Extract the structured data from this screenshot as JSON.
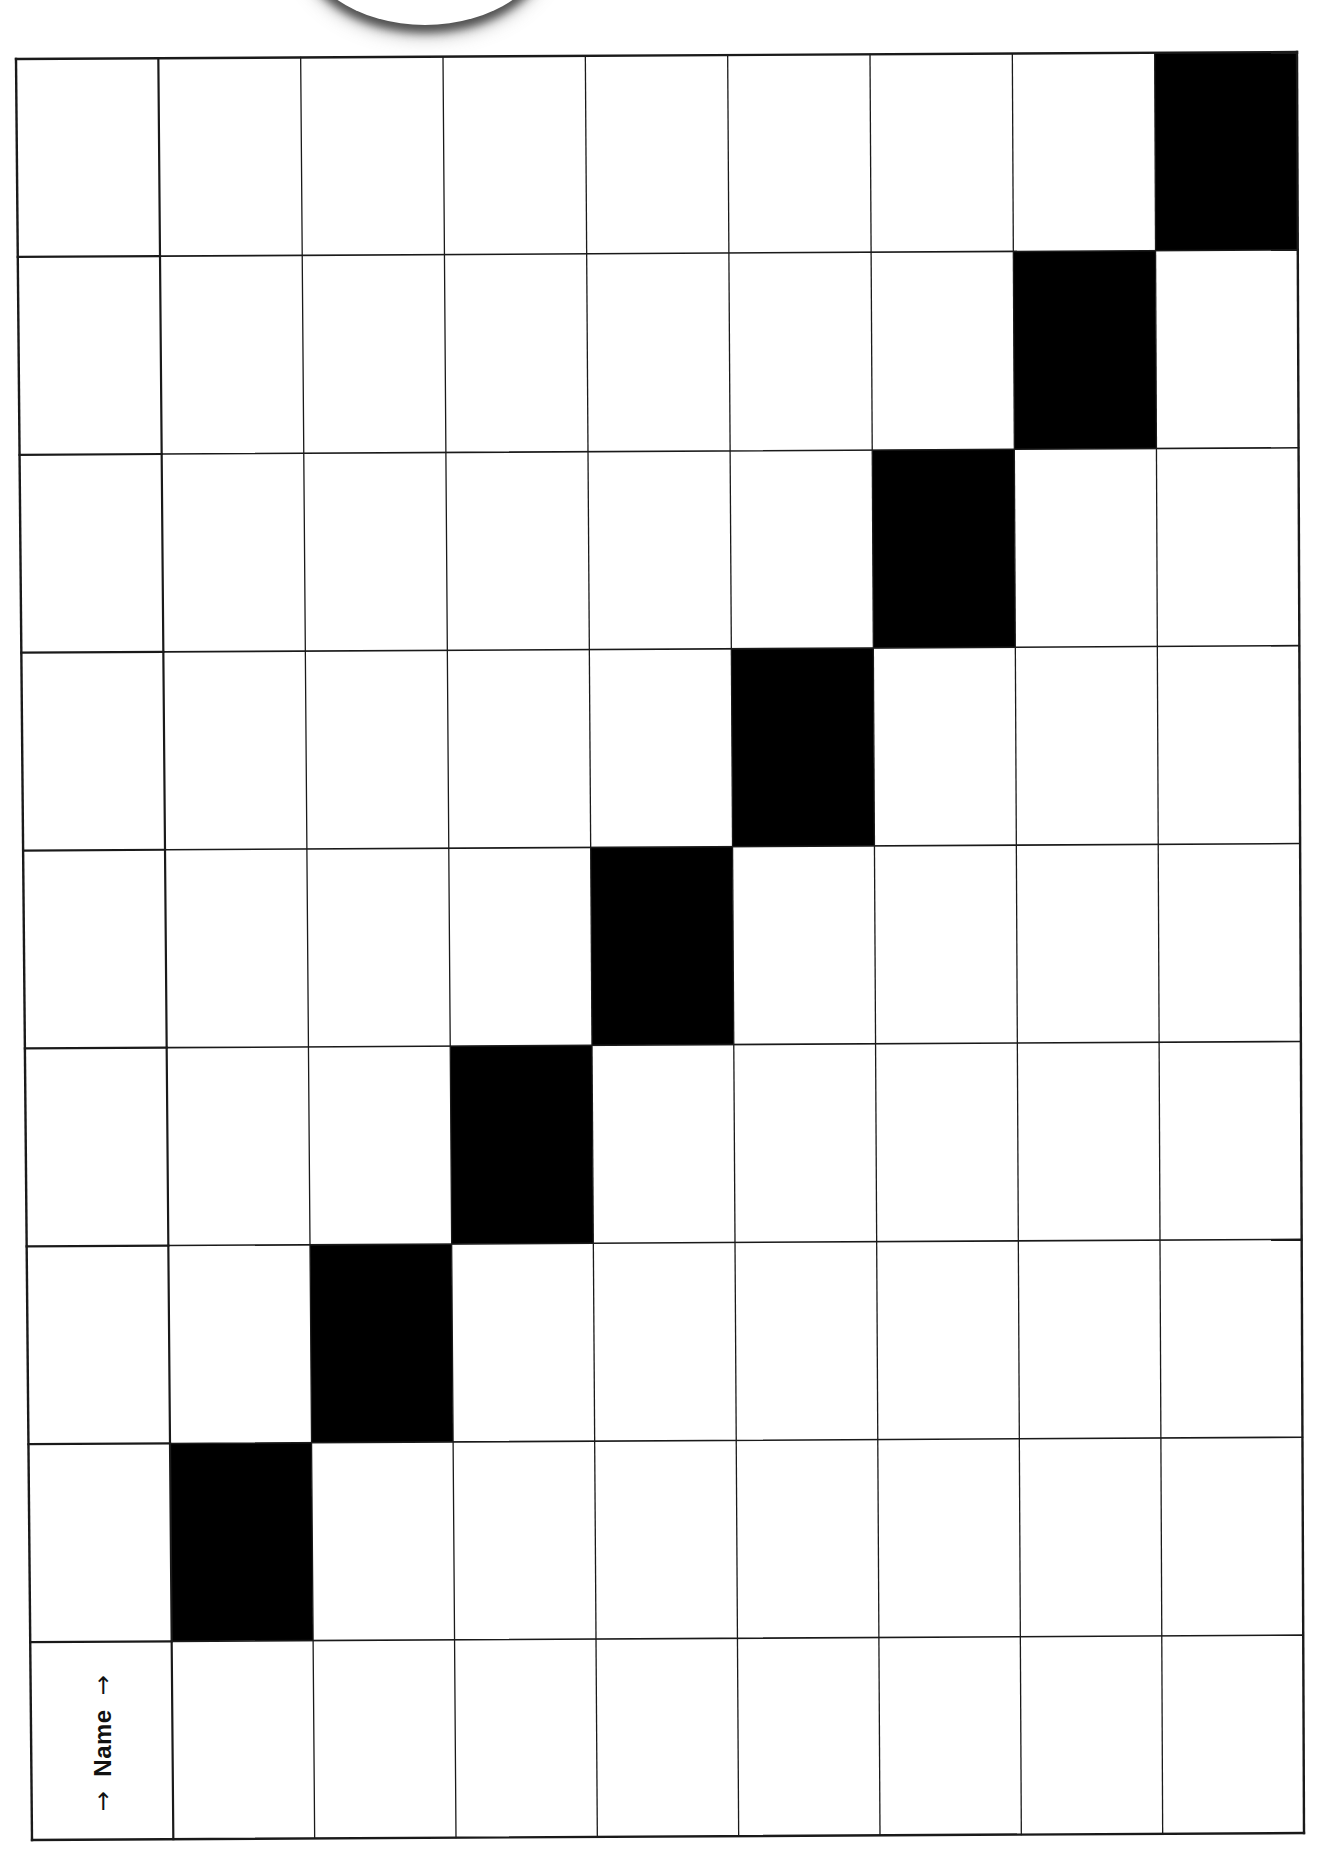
{
  "worksheet": {
    "columns": 9,
    "rows": 9,
    "filled_cells": [
      {
        "row": 1,
        "col": 9
      },
      {
        "row": 2,
        "col": 8
      },
      {
        "row": 3,
        "col": 7
      },
      {
        "row": 4,
        "col": 6
      },
      {
        "row": 5,
        "col": 5
      },
      {
        "row": 6,
        "col": 4
      },
      {
        "row": 7,
        "col": 3
      },
      {
        "row": 8,
        "col": 2
      }
    ],
    "fill_color": "#000000",
    "line_color": "#1a1a1a",
    "background_color": "#ffffff",
    "name_label": {
      "arrow_left": "→",
      "text": "Name",
      "arrow_right": "→"
    }
  }
}
